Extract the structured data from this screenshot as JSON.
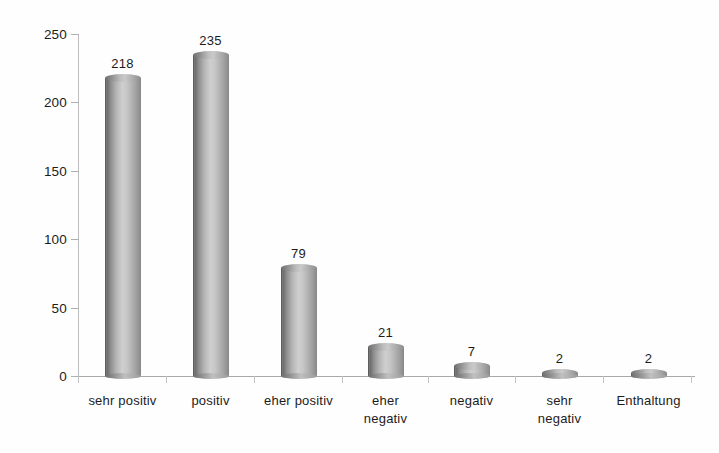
{
  "chart_data": {
    "type": "bar",
    "title": "",
    "subtitle": "",
    "xlabel": "",
    "ylabel": "",
    "categories": [
      "sehr positiv",
      "positiv",
      "eher positiv",
      "eher\nnegativ",
      "negativ",
      "sehr\nnegativ",
      "Enthaltung"
    ],
    "values": [
      218,
      235,
      79,
      21,
      7,
      2,
      2
    ],
    "value_labels": [
      "218",
      "235",
      "79",
      "21",
      "7",
      "2",
      "2"
    ],
    "ylim": [
      0,
      250
    ],
    "yticks": [
      0,
      50,
      100,
      150,
      200,
      250
    ],
    "ytick_labels": [
      "0",
      "50",
      "100",
      "150",
      "200",
      "250"
    ],
    "grid": false,
    "legend": false,
    "legend_position": "none",
    "series": [
      {
        "name": "Antworten",
        "values": [
          218,
          235,
          79,
          21,
          7,
          2,
          2
        ]
      }
    ],
    "bar_style": "cylinder",
    "colors": {
      "bar_dark": "#6e6e6e",
      "bar_light": "#cfcfcf",
      "axis": "#b0b0b0",
      "text": "#1c1c1c",
      "background": "#fefefe"
    }
  }
}
